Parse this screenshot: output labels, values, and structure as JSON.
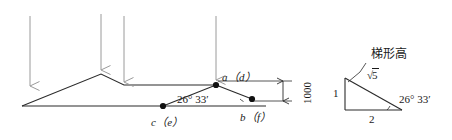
{
  "figure": {
    "stroke_color": "#2b2b2b",
    "arrow_color": "#9a9a9a",
    "text_color": "#1a1a1a"
  },
  "main_diagram": {
    "points": {
      "a": "a（d）",
      "b": "b（f）",
      "c": "c（e）"
    },
    "angle_label": "26° 33′",
    "dimension_label": "1000",
    "load_arrows_count": 4
  },
  "inset_triangle": {
    "vertical_leg_label": "1",
    "horizontal_leg_label": "2",
    "hypotenuse_radical": "√",
    "hypotenuse_radicand": "5",
    "angle_label": "26° 33′",
    "callout_label": "梯形高"
  }
}
